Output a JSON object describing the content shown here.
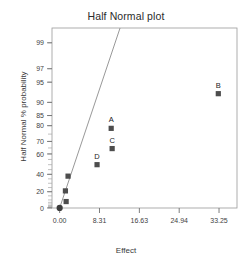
{
  "chart_data": {
    "type": "scatter",
    "title": "Half Normal plot",
    "xlabel": "Effect",
    "ylabel": "Half Normal % probability",
    "xlim": [
      -1.6,
      37.0
    ],
    "ylim": [
      0,
      99.5
    ],
    "grid": false,
    "legend": null,
    "xticks": [
      "0.00",
      "8.31",
      "16.63",
      "24.94",
      "33.25"
    ],
    "xtick_values": [
      0.0,
      8.31,
      16.63,
      24.94,
      33.25
    ],
    "yticks": [
      "0",
      "20",
      "40",
      "60",
      "70",
      "80",
      "85",
      "90",
      "95",
      "97",
      "99"
    ],
    "ytick_values": [
      0,
      20,
      40,
      60,
      70,
      80,
      85,
      90,
      95,
      97,
      99
    ],
    "series": [
      {
        "name": "effects",
        "marker": "square",
        "color": "#4d4d4d",
        "points": [
          {
            "x": 0.0,
            "y": 0.0,
            "label": "",
            "marker": "circle"
          },
          {
            "x": 1.35,
            "y": 8.0,
            "label": ""
          },
          {
            "x": 1.2,
            "y": 21.0,
            "label": ""
          },
          {
            "x": 1.75,
            "y": 38.0,
            "label": ""
          },
          {
            "x": 7.8,
            "y": 50.0,
            "label": "D"
          },
          {
            "x": 10.95,
            "y": 64.5,
            "label": "C"
          },
          {
            "x": 10.75,
            "y": 78.5,
            "label": "A"
          },
          {
            "x": 33.1,
            "y": 92.5,
            "label": "B"
          }
        ]
      }
    ],
    "reference_line": {
      "name": "half-normal-reference-line",
      "color": "#8c8c8c",
      "x_start": 0.0,
      "y_start": 0.0,
      "x_end": 12.6,
      "y_end": 99.5
    }
  }
}
